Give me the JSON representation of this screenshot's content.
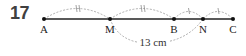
{
  "exercise_number": "17",
  "points": [
    {
      "label": "A",
      "x": 44
    },
    {
      "label": "M",
      "x": 110
    },
    {
      "label": "B",
      "x": 174
    },
    {
      "label": "N",
      "x": 203
    },
    {
      "label": "C",
      "x": 233
    }
  ],
  "arcs": [
    {
      "from": "A",
      "to": "M",
      "mark": "double-tick"
    },
    {
      "from": "M",
      "to": "B",
      "mark": "double-tick"
    },
    {
      "from": "B",
      "to": "N",
      "mark": "single-tick"
    },
    {
      "from": "N",
      "to": "C",
      "mark": "single-tick"
    }
  ],
  "measurement": {
    "from": "M",
    "to": "N",
    "label": "13 cm"
  },
  "colors": {
    "line": "#222222",
    "arc": "#9a9a9a",
    "number": "#404040"
  }
}
